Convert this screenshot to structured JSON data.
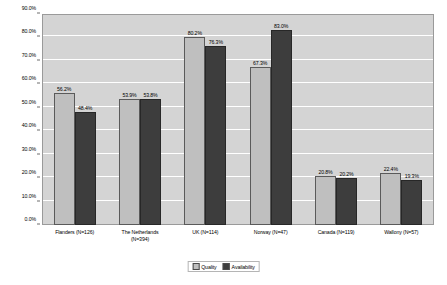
{
  "chart_data": {
    "type": "bar",
    "title": "",
    "subtitle": "",
    "xlabel": "",
    "ylabel": "",
    "ylim": [
      0,
      90
    ],
    "ytick_step": 10,
    "grid": true,
    "legend_position": "bottom",
    "categories": [
      "Flanders (N=126)",
      "The Netherlands (N=394)",
      "UK (N=114)",
      "Norway (N=47)",
      "Canada (N=119)",
      "Wallony (N=57)"
    ],
    "category_lines": [
      [
        "Flanders (N=126)"
      ],
      [
        "The Netherlands",
        "(N=394)"
      ],
      [
        "UK (N=114)"
      ],
      [
        "Norway (N=47)"
      ],
      [
        "Canada (N=119)"
      ],
      [
        "Wallony (N=57)"
      ]
    ],
    "series": [
      {
        "name": "Quality",
        "color": "#bfbfbf",
        "values": [
          56.2,
          53.9,
          80.2,
          67.3,
          20.8,
          22.4
        ],
        "labels": [
          "56.2%",
          "53.9%",
          "80.2%",
          "67.3%",
          "20.8%",
          "22.4%"
        ]
      },
      {
        "name": "Availability",
        "color": "#3d3d3d",
        "values": [
          48.4,
          53.8,
          76.3,
          83.0,
          20.2,
          19.3
        ],
        "labels": [
          "48.4%",
          "53.8%",
          "76.3%",
          "83.0%",
          "20.2%",
          "19.3%"
        ]
      }
    ],
    "ytick_labels": [
      "0.0%",
      "10.0%",
      "20.0%",
      "30.0%",
      "40.0%",
      "50.0%",
      "60.0%",
      "70.0%",
      "80.0%",
      "90.0%"
    ],
    "ytick_values": [
      0,
      10,
      20,
      30,
      40,
      50,
      60,
      70,
      80,
      90
    ],
    "legend": [
      {
        "label": "Quality",
        "color": "#bfbfbf"
      },
      {
        "label": "Availability",
        "color": "#3d3d3d"
      }
    ],
    "plot_background": "#d4d4d4",
    "gridline_color": "#ffffff"
  }
}
